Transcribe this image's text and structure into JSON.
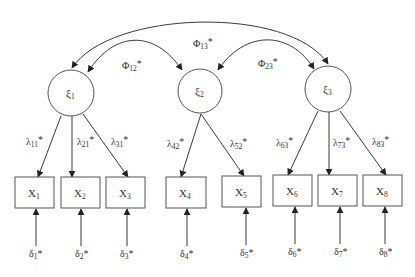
{
  "diagram": {
    "type": "structural-equation-model",
    "colors": {
      "stroke": "#3a3a3a",
      "text": "#333333",
      "background": "#ffffff"
    },
    "latent": [
      {
        "id": "xi1",
        "symbol": "ξ",
        "sub": "1",
        "cx": 71,
        "cy": 93,
        "r": 23
      },
      {
        "id": "xi2",
        "symbol": "ξ",
        "sub": "2",
        "cx": 200,
        "cy": 91,
        "r": 22
      },
      {
        "id": "xi3",
        "symbol": "ξ",
        "sub": "3",
        "cx": 328,
        "cy": 89,
        "r": 23
      }
    ],
    "observed": [
      {
        "id": "x1",
        "symbol": "X",
        "sub": "1",
        "x": 15,
        "y": 177,
        "w": 39,
        "h": 31
      },
      {
        "id": "x2",
        "symbol": "X",
        "sub": "2",
        "x": 61,
        "y": 177,
        "w": 39,
        "h": 31
      },
      {
        "id": "x3",
        "symbol": "X",
        "sub": "3",
        "x": 106,
        "y": 177,
        "w": 39,
        "h": 31
      },
      {
        "id": "x4",
        "symbol": "X",
        "sub": "4",
        "x": 166,
        "y": 177,
        "w": 40,
        "h": 31
      },
      {
        "id": "x5",
        "symbol": "X",
        "sub": "5",
        "x": 222,
        "y": 176,
        "w": 39,
        "h": 31
      },
      {
        "id": "x6",
        "symbol": "X",
        "sub": "6",
        "x": 273,
        "y": 175,
        "w": 39,
        "h": 31
      },
      {
        "id": "x7",
        "symbol": "X",
        "sub": "7",
        "x": 318,
        "y": 175,
        "w": 39,
        "h": 31
      },
      {
        "id": "x8",
        "symbol": "X",
        "sub": "8",
        "x": 363,
        "y": 175,
        "w": 39,
        "h": 31
      }
    ],
    "covariances": [
      {
        "id": "phi12",
        "symbol": "Φ",
        "sub": "12",
        "star": "*",
        "from": "xi1",
        "to": "xi2"
      },
      {
        "id": "phi13",
        "symbol": "Φ",
        "sub": "13",
        "star": "*",
        "from": "xi1",
        "to": "xi3"
      },
      {
        "id": "phi23",
        "symbol": "Φ",
        "sub": "23",
        "star": "*",
        "from": "xi2",
        "to": "xi3"
      }
    ],
    "loadings": [
      {
        "id": "lambda11",
        "symbol": "λ",
        "sub": "11",
        "star": "*",
        "from": "xi1",
        "to": "x1"
      },
      {
        "id": "lambda21",
        "symbol": "λ",
        "sub": "21",
        "star": "*",
        "from": "xi1",
        "to": "x2"
      },
      {
        "id": "lambda31",
        "symbol": "λ",
        "sub": "31",
        "star": "*",
        "from": "xi1",
        "to": "x3"
      },
      {
        "id": "lambda42",
        "symbol": "λ",
        "sub": "42",
        "star": "*",
        "from": "xi2",
        "to": "x4"
      },
      {
        "id": "lambda52",
        "symbol": "λ",
        "sub": "52",
        "star": "*",
        "from": "xi2",
        "to": "x5"
      },
      {
        "id": "lambda63",
        "symbol": "λ",
        "sub": "63",
        "star": "*",
        "from": "xi3",
        "to": "x6"
      },
      {
        "id": "lambda73",
        "symbol": "λ",
        "sub": "73",
        "star": "*",
        "from": "xi3",
        "to": "x7"
      },
      {
        "id": "lambda83",
        "symbol": "λ",
        "sub": "83",
        "star": "*",
        "from": "xi3",
        "to": "x8"
      }
    ],
    "errors": [
      {
        "id": "delta1",
        "symbol": "δ",
        "sub": "1",
        "star": "*",
        "to": "x1"
      },
      {
        "id": "delta2",
        "symbol": "δ",
        "sub": "2",
        "star": "*",
        "to": "x2"
      },
      {
        "id": "delta3",
        "symbol": "δ",
        "sub": "3",
        "star": "*",
        "to": "x3"
      },
      {
        "id": "delta4",
        "symbol": "δ",
        "sub": "4",
        "star": "*",
        "to": "x4"
      },
      {
        "id": "delta5",
        "symbol": "δ",
        "sub": "5",
        "star": "*",
        "to": "x5"
      },
      {
        "id": "delta6",
        "symbol": "δ",
        "sub": "6",
        "star": "*",
        "to": "x6"
      },
      {
        "id": "delta7",
        "symbol": "δ",
        "sub": "7",
        "star": "*",
        "to": "x7"
      },
      {
        "id": "delta8",
        "symbol": "δ",
        "sub": "8",
        "star": "*",
        "to": "x8"
      }
    ]
  }
}
